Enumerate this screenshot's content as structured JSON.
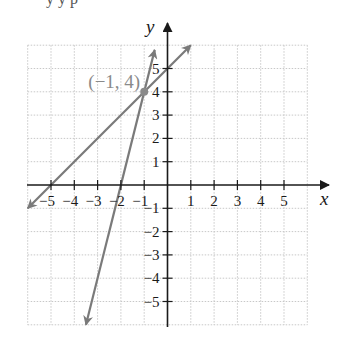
{
  "chart_data": {
    "type": "line",
    "title": "",
    "xlabel": "x",
    "ylabel": "y",
    "xlim": [
      -6,
      6
    ],
    "ylim": [
      -6,
      6
    ],
    "grid": true,
    "x_ticks": [
      -5,
      -4,
      -3,
      -2,
      -1,
      1,
      2,
      3,
      4,
      5
    ],
    "y_ticks": [
      -5,
      -4,
      -3,
      -2,
      -1,
      1,
      2,
      3,
      4,
      5
    ],
    "x_tick_labels": [
      "−5",
      "−4",
      "−3",
      "−2",
      "−1",
      "1",
      "2",
      "3",
      "4",
      "5"
    ],
    "y_tick_labels": [
      "−5",
      "−4",
      "−3",
      "−2",
      "−1",
      "1",
      "2",
      "3",
      "4",
      "5"
    ],
    "series": [
      {
        "name": "steep line",
        "equation": "y = 4x + 8",
        "points": [
          [
            -3.5,
            -6
          ],
          [
            -0.55,
            5.8
          ]
        ],
        "color": "#7a7a7a",
        "arrows": "both"
      },
      {
        "name": "shallow line",
        "equation": "y = x + 5",
        "points": [
          [
            -6,
            -1
          ],
          [
            1,
            6
          ]
        ],
        "color": "#7a7a7a",
        "arrows": "both"
      }
    ],
    "annotations": [
      {
        "text": "(−1, 4)",
        "x": -1,
        "y": 4,
        "marker": "dot",
        "color": "#8a8a8a"
      }
    ]
  },
  "labels": {
    "x_axis": "x",
    "y_axis": "y",
    "intersection": "(−1, 4)",
    "clipped_top_text": "y   y p"
  },
  "colors": {
    "axis": "#1a1a1a",
    "line": "#7a7a7a",
    "grid": "#c8c8c8",
    "label_gray": "#8a8a8a"
  }
}
